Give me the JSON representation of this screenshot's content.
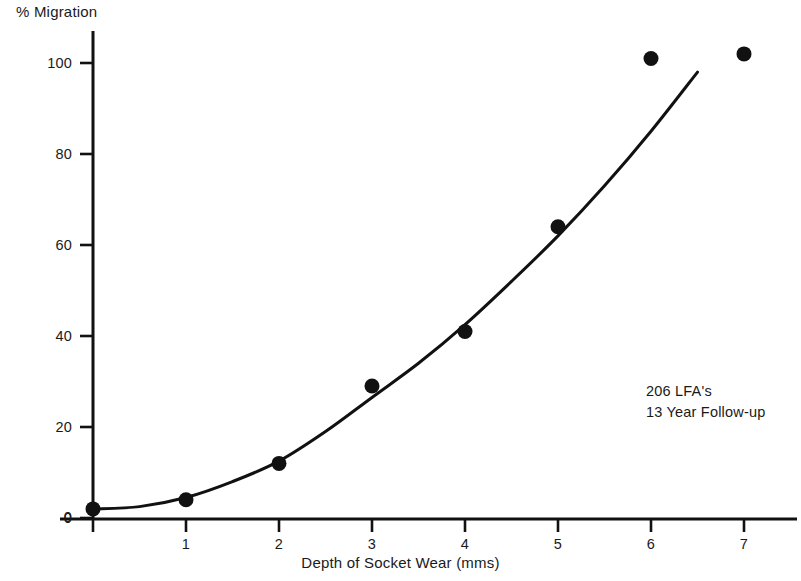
{
  "chart_data": {
    "type": "scatter",
    "title": "",
    "xlabel": "Depth of Socket Wear (mms)",
    "ylabel": "% Migration",
    "xlim": [
      0,
      7.6
    ],
    "ylim": [
      0,
      108
    ],
    "grid": false,
    "legend": "none",
    "x_ticks": [
      "0",
      "1",
      "2",
      "3",
      "4",
      "5",
      "6",
      "7"
    ],
    "x_tick_values": [
      0,
      1,
      2,
      3,
      4,
      5,
      6,
      7
    ],
    "y_ticks": [
      "0",
      "20",
      "40",
      "60",
      "80",
      "100"
    ],
    "y_tick_values": [
      0,
      20,
      40,
      60,
      80,
      100
    ],
    "x": [
      0,
      1,
      2,
      3,
      4,
      5,
      6,
      7
    ],
    "values": [
      2,
      4,
      12,
      29,
      41,
      64,
      101,
      102
    ],
    "series": [
      {
        "name": "observed",
        "type": "scatter",
        "x": [
          0,
          1,
          2,
          3,
          4,
          5,
          6,
          7
        ],
        "values": [
          2,
          4,
          12,
          29,
          41,
          64,
          101,
          102
        ],
        "marker": "filled-circle",
        "color": "#111111"
      },
      {
        "name": "fitted-curve",
        "type": "line",
        "x": [
          0,
          0.5,
          1,
          1.5,
          2,
          2.5,
          3,
          3.5,
          4,
          4.5,
          5,
          5.5,
          6,
          6.5
        ],
        "values": [
          2,
          2.5,
          4.5,
          8,
          12.5,
          19,
          26.5,
          34,
          42.5,
          52,
          62,
          73,
          85,
          98
        ],
        "color": "#111111"
      }
    ],
    "annotations": [
      {
        "text": "206 LFA's"
      },
      {
        "text": "13 Year Follow-up"
      }
    ]
  },
  "axes": {
    "y_title": "% Migration",
    "x_title": "Depth of Socket Wear (mms)"
  },
  "annotation": {
    "line1": "206 LFA's",
    "line2": "13 Year Follow-up"
  },
  "colors": {
    "ink": "#111111",
    "background": "#ffffff"
  }
}
